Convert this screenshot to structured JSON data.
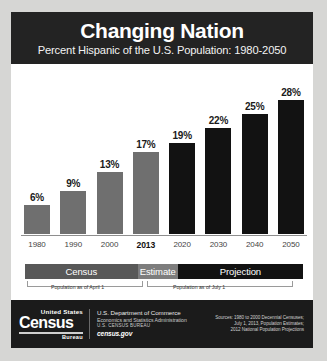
{
  "header": {
    "title": "Changing Nation",
    "subtitle": "Percent Hispanic of the U.S. Population: 1980-2050"
  },
  "chart_data": {
    "type": "bar",
    "title": "Changing Nation",
    "subtitle": "Percent Hispanic of the U.S. Population: 1980-2050",
    "xlabel": "",
    "ylabel": "Percent Hispanic",
    "ylim": [
      0,
      30
    ],
    "grid": false,
    "legend": false,
    "categories": [
      "1980",
      "1990",
      "2000",
      "2013",
      "2020",
      "2030",
      "2040",
      "2050"
    ],
    "values": [
      6,
      9,
      13,
      17,
      19,
      22,
      25,
      28
    ],
    "data_labels": [
      "6%",
      "9%",
      "13%",
      "17%",
      "19%",
      "22%",
      "25%",
      "28%"
    ],
    "series": [
      {
        "name": "Percent Hispanic",
        "values": [
          6,
          9,
          13,
          17,
          19,
          22,
          25,
          28
        ],
        "bar_colors": [
          "#6f6f6f",
          "#6f6f6f",
          "#6f6f6f",
          "#6f6f6f",
          "#121212",
          "#121212",
          "#121212",
          "#121212"
        ]
      }
    ],
    "highlighted_category": "2013",
    "annotations": [
      {
        "label": "Census",
        "span": [
          "1980",
          "2000"
        ],
        "color": "#585858"
      },
      {
        "label": "Estimate",
        "span": [
          "2013",
          "2013"
        ],
        "color": "#7d7d7d"
      },
      {
        "label": "Projection",
        "span": [
          "2020",
          "2050"
        ],
        "color": "#121212"
      }
    ]
  },
  "bands": [
    {
      "label": "Census"
    },
    {
      "label": "Estimate"
    },
    {
      "label": "Projection"
    }
  ],
  "notes": {
    "april": "Population as of April 1",
    "july": "Population as of July 1"
  },
  "footer": {
    "logo": {
      "top": "United States",
      "main": "Census",
      "bureau": "Bureau"
    },
    "dept": {
      "line1": "U.S. Department of Commerce",
      "line2": "Economics and Statistics Administration",
      "line3": "U.S. CENSUS BUREAU",
      "line4": "census.gov"
    },
    "sources": [
      "Sources: 1980 to 2000 Decennial Censuses;",
      "July 1, 2013, Population Estimates;",
      "2012 National Population Projections"
    ]
  },
  "colors": {
    "header_bg": "#232323",
    "bar_gray": "#6f6f6f",
    "bar_black": "#121212",
    "footer_bg": "#1b1b1b",
    "page_bg": "#d6d6d4"
  }
}
